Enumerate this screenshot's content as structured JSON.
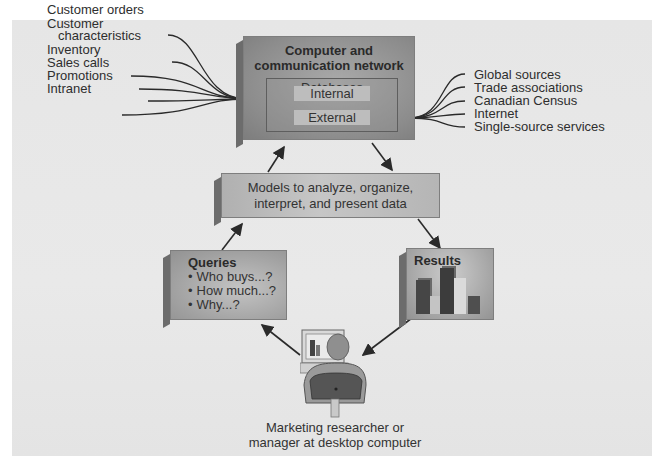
{
  "diagram": {
    "type": "marketing-information-system flow",
    "colors": {
      "panel": "#e7e7e7",
      "box": "#9e9e9e",
      "box_dark": "#6c6c6c",
      "line": "#2a2a2a",
      "text": "#2e2e2e"
    }
  },
  "internal_sources": [
    "Customer orders",
    "Customer",
    "characteristics",
    "Inventory",
    "Sales calls",
    "Promotions",
    "Intranet"
  ],
  "external_sources": [
    "Global sources",
    "Trade associations",
    "Canadian Census",
    "Internet",
    "Single-source services"
  ],
  "computer_network": {
    "title_line1": "Computer and",
    "title_line2": "communication network",
    "databases_label": "Databases",
    "internal_label": "Internal",
    "external_label": "External"
  },
  "models": {
    "line1": "Models to analyze, organize,",
    "line2": "interpret, and present data"
  },
  "queries": {
    "title": "Queries",
    "items": [
      "Who buys...?",
      "How much...?",
      "Why...?"
    ]
  },
  "results": {
    "title": "Results",
    "bars": [
      {
        "color": "#4a4a4a",
        "height": 34
      },
      {
        "color": "#bdbdbd",
        "height": 18
      },
      {
        "color": "#3e3e3e",
        "height": 46
      },
      {
        "color": "#d6d6d6",
        "height": 36
      },
      {
        "color": "#555555",
        "height": 18
      }
    ]
  },
  "user": {
    "caption_line1": "Marketing researcher or",
    "caption_line2": "manager at desktop computer"
  }
}
